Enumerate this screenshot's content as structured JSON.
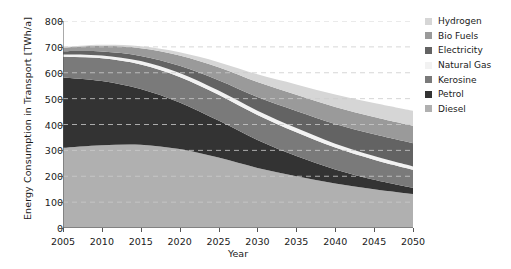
{
  "chart_data": {
    "type": "area",
    "stacked": true,
    "title": "",
    "xlabel": "Year",
    "ylabel": "Energy Consumption in Transport [TWh/a]",
    "xlim": [
      2005,
      2050
    ],
    "ylim": [
      0,
      800
    ],
    "yticks": [
      0,
      100,
      200,
      300,
      400,
      500,
      600,
      700,
      800
    ],
    "xticks": [
      2005,
      2010,
      2015,
      2020,
      2025,
      2030,
      2035,
      2040,
      2045,
      2050
    ],
    "grid": "horizontal-dashed",
    "legend_position": "right",
    "x": [
      2005,
      2010,
      2015,
      2020,
      2025,
      2030,
      2035,
      2040,
      2045,
      2050
    ],
    "series": [
      {
        "name": "Diesel",
        "color": "#b0b0b0",
        "values": [
          310,
          320,
          322,
          305,
          272,
          232,
          200,
          172,
          150,
          131
        ]
      },
      {
        "name": "Petrol",
        "color": "#333333",
        "values": [
          272,
          248,
          215,
          180,
          143,
          108,
          78,
          54,
          36,
          24
        ]
      },
      {
        "name": "Kerosine",
        "color": "#7a7a7a",
        "values": [
          80,
          88,
          95,
          99,
          100,
          97,
          92,
          85,
          78,
          70
        ]
      },
      {
        "name": "Natural Gas",
        "color": "#f2f2f2",
        "values": [
          9,
          11,
          13,
          15,
          16,
          16,
          16,
          15,
          14,
          13
        ]
      },
      {
        "name": "Electricity",
        "color": "#636363",
        "values": [
          12,
          15,
          20,
          28,
          40,
          53,
          66,
          76,
          84,
          90
        ]
      },
      {
        "name": "Bio Fuels",
        "color": "#9a9a9a",
        "values": [
          14,
          22,
          30,
          40,
          50,
          58,
          63,
          66,
          67,
          67
        ]
      },
      {
        "name": "Hydrogen",
        "color": "#d6d6d6",
        "values": [
          2,
          4,
          7,
          12,
          20,
          30,
          40,
          48,
          54,
          58
        ]
      }
    ]
  },
  "legend": {
    "items": [
      {
        "label": "Hydrogen",
        "color": "#d6d6d6"
      },
      {
        "label": "Bio Fuels",
        "color": "#9a9a9a"
      },
      {
        "label": "Electricity",
        "color": "#636363"
      },
      {
        "label": "Natural Gas",
        "color": "#f2f2f2"
      },
      {
        "label": "Kerosine",
        "color": "#7a7a7a"
      },
      {
        "label": "Petrol",
        "color": "#333333"
      },
      {
        "label": "Diesel",
        "color": "#b0b0b0"
      }
    ]
  }
}
